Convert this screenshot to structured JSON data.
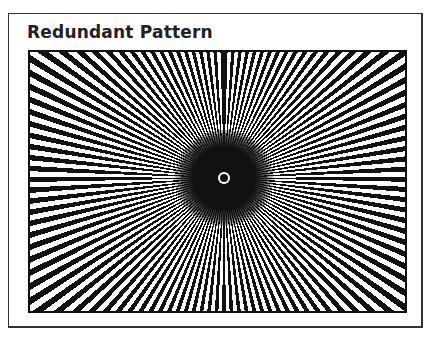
{
  "figure": {
    "title": "Redundant Pattern",
    "pattern": {
      "type": "radial-starburst",
      "ray_color": "#111111",
      "background_color": "#ffffff",
      "center_marker": "small white circle"
    }
  }
}
